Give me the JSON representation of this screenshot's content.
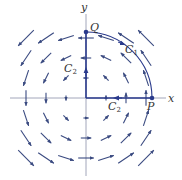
{
  "figure": {
    "type": "vector-field-line-integral",
    "field": "F(x,y) = (-y, x)",
    "colors": {
      "field_arrows": "#3a4a80",
      "path": "#2a3a8c",
      "axes": "#8a8fa8",
      "labels": "#333333"
    },
    "axes": {
      "x_label": "x",
      "y_label": "y"
    },
    "points": {
      "P": {
        "label": "P",
        "coords": [
          1,
          0
        ]
      },
      "Q": {
        "label": "Q",
        "coords": [
          0,
          1
        ]
      }
    },
    "curves": [
      {
        "name": "C1",
        "label_main": "C",
        "label_sub": "1",
        "description": "quarter circle arc from P to Q, counterclockwise"
      },
      {
        "name": "C2",
        "label_main": "C",
        "label_sub": "2",
        "description": "straight segments P to origin, then origin to Q"
      },
      {
        "name": "C2b",
        "label_main": "C",
        "label_sub": "2",
        "description": "second C2 label on x-axis segment"
      }
    ],
    "grid": {
      "x_values": [
        -3,
        -2,
        -1,
        0,
        1,
        2,
        3
      ],
      "y_values": [
        -3,
        -2,
        -1,
        0,
        1,
        2,
        3
      ]
    }
  }
}
